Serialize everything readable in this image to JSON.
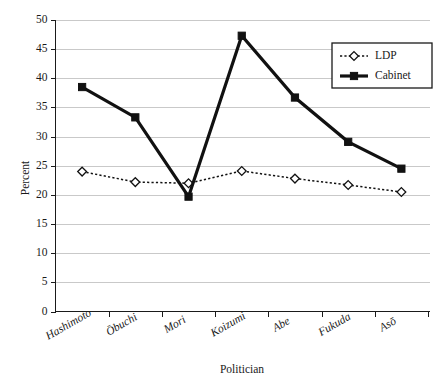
{
  "chart_data": {
    "type": "line",
    "title": "",
    "subtitle": "",
    "xlabel": "Politician",
    "ylabel": "Percent",
    "categories": [
      "Hashimoto",
      "Ōbuchi",
      "Mori",
      "Koizumi",
      "Abe",
      "Fukuda",
      "Asō"
    ],
    "series": [
      {
        "name": "LDP",
        "values": [
          24.0,
          22.2,
          22.0,
          24.1,
          22.8,
          21.7,
          20.5
        ],
        "marker": "open-diamond",
        "line_style": "dotted",
        "color": "#111111"
      },
      {
        "name": "Cabinet",
        "values": [
          38.5,
          33.3,
          19.7,
          47.3,
          36.7,
          29.1,
          24.5
        ],
        "marker": "filled-square",
        "line_style": "solid",
        "color": "#111111"
      }
    ],
    "ylim": [
      0,
      50
    ],
    "ytick_values": [
      0,
      5,
      10,
      15,
      20,
      25,
      30,
      35,
      40,
      45,
      50
    ],
    "ytick_labels": [
      "0",
      "5",
      "10",
      "15",
      "20",
      "25",
      "30",
      "35",
      "40",
      "45",
      "50"
    ],
    "grid": true,
    "grid_axis": "y",
    "grid_color": "#c9c9c9",
    "legend_position": "top-right-inside",
    "legend_entries": [
      "LDP",
      "Cabinet"
    ],
    "xtick_label_rotation": -30,
    "background_color": "#ffffff",
    "axis_color": "#1a1a1a"
  }
}
